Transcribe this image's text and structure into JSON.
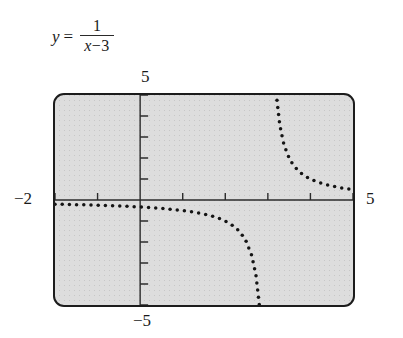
{
  "equation": {
    "lhs": "y",
    "equals": "=",
    "numerator": "1",
    "denominator_var": "x",
    "denominator_op": "−",
    "denominator_num": "3"
  },
  "window_labels": {
    "ymax": "5",
    "ymin": "−5",
    "xmin": "−2",
    "xmax": "5"
  },
  "chart_data": {
    "type": "scatter",
    "xlabel": "",
    "ylabel": "",
    "xlim": [
      -2,
      5
    ],
    "ylim": [
      -5,
      5
    ],
    "grid": false,
    "legend": null,
    "style": "dotted-graphing-calculator",
    "asymptote_vertical": 3,
    "asymptote_horizontal": 0,
    "xticks": [
      -2,
      -1,
      0,
      1,
      2,
      3,
      4,
      5
    ],
    "yticks": [
      -5,
      -4,
      -3,
      -2,
      -1,
      0,
      1,
      2,
      3,
      4,
      5
    ],
    "tick_step": 1,
    "series": [
      {
        "name": "left branch (x < 3)",
        "x": [
          -2.0,
          -1.86,
          -1.72,
          -1.58,
          -1.44,
          -1.3,
          -1.16,
          -1.02,
          -0.88,
          -0.74,
          -0.6,
          -0.46,
          -0.32,
          -0.18,
          -0.04,
          0.1,
          0.24,
          0.38,
          0.52,
          0.66,
          0.8,
          0.94,
          1.08,
          1.22,
          1.36,
          1.5,
          1.64,
          1.78,
          1.92,
          2.06,
          2.2,
          2.34,
          2.48,
          2.62,
          2.72,
          2.8,
          2.86,
          2.9,
          2.93,
          2.95,
          2.97,
          2.98
        ],
        "y": [
          -0.2,
          -0.205,
          -0.212,
          -0.218,
          -0.225,
          -0.233,
          -0.24,
          -0.249,
          -0.258,
          -0.267,
          -0.278,
          -0.289,
          -0.301,
          -0.314,
          -0.329,
          -0.345,
          -0.362,
          -0.381,
          -0.403,
          -0.427,
          -0.455,
          -0.485,
          -0.521,
          -0.562,
          -0.61,
          -0.667,
          -0.735,
          -0.82,
          -0.926,
          -1.064,
          -1.25,
          -1.504,
          -1.923,
          -2.632,
          -3.571,
          -5.0,
          -7.14,
          -10.0,
          -14.3,
          -20.0,
          -33.3,
          -50.0
        ]
      },
      {
        "name": "right branch (x > 3)",
        "x": [
          3.02,
          3.03,
          3.05,
          3.07,
          3.1,
          3.14,
          3.2,
          3.28,
          3.36,
          3.46,
          3.56,
          3.68,
          3.8,
          3.92,
          4.04,
          4.16,
          4.28,
          4.4,
          4.52,
          4.64,
          4.76,
          4.88,
          5.0
        ],
        "y": [
          50.0,
          33.3,
          20.0,
          14.3,
          10.0,
          7.14,
          5.0,
          3.571,
          2.778,
          2.174,
          1.786,
          1.471,
          1.25,
          1.087,
          0.962,
          0.862,
          0.781,
          0.714,
          0.658,
          0.61,
          0.568,
          0.532,
          0.5
        ]
      }
    ]
  }
}
